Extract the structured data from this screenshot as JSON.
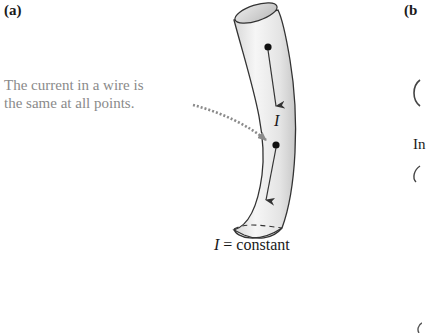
{
  "panels": {
    "a": {
      "label": "(a)",
      "annotation_line1": "The current in a wire is",
      "annotation_line2": "the same at all points.",
      "current_symbol": "I",
      "caption_var": "I",
      "caption_rest": " = constant"
    },
    "b": {
      "label": "(b",
      "partial_text": "In"
    }
  },
  "colors": {
    "annotation_text": "#8a8a8a",
    "wire_fill_light": "#f4f4f4",
    "wire_fill_dark": "#cfcfcf",
    "outline": "#333333",
    "leader_dots": "#8a8a8a",
    "arrow": "#333333"
  }
}
